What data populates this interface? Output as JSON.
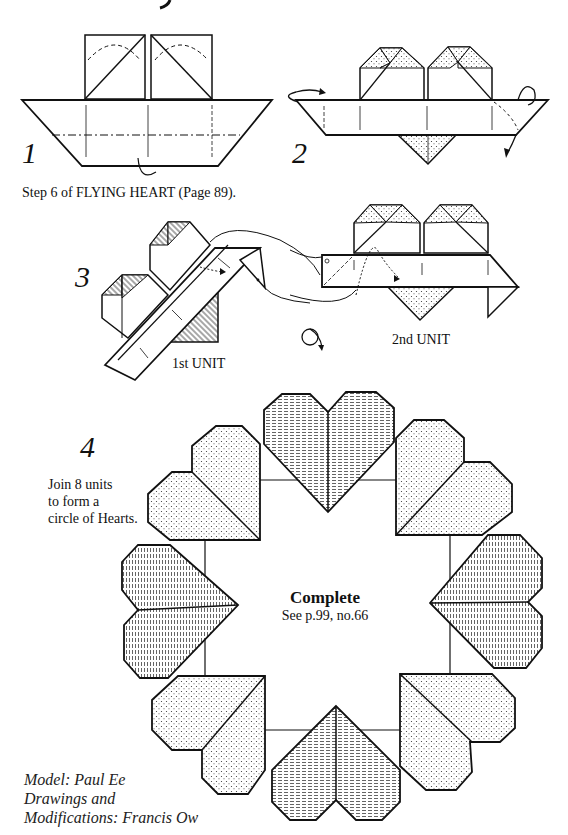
{
  "diagram": {
    "steps": [
      {
        "number": "1",
        "caption": "Step 6 of  FLYING  HEART  (Page 89)."
      },
      {
        "number": "2"
      },
      {
        "number": "3",
        "labels": {
          "first_unit": "1st UNIT",
          "second_unit": "2nd UNIT"
        }
      },
      {
        "number": "4",
        "instruction": [
          "Join 8 units",
          "to form a",
          "circle of Hearts."
        ]
      }
    ],
    "result": {
      "title": "Complete",
      "reference": "See p.99, no.66"
    },
    "credits": [
      "Model: Paul Ee",
      "Drawings and",
      "Modifications: Francis Ow"
    ],
    "ring": {
      "heart_count": 8,
      "textures": [
        "hatched",
        "dotted",
        "dotted",
        "hatched",
        "dotted",
        "hatched",
        "dotted",
        "hatched"
      ]
    },
    "colors": {
      "ink": "#111111",
      "paper": "#ffffff",
      "dot_fill": "#f4f4f4"
    }
  }
}
